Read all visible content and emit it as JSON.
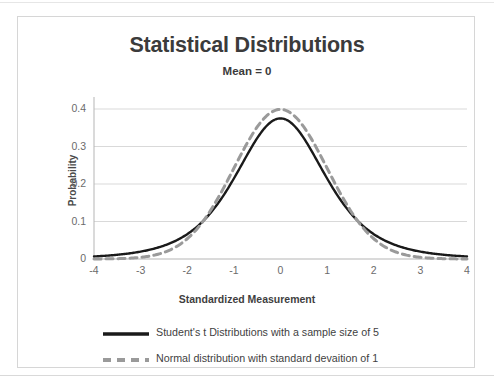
{
  "chart_data": {
    "type": "line",
    "title": "Statistical Distributions",
    "subtitle": "Mean = 0",
    "xlabel": "Standardized Measurement",
    "ylabel": "Probability",
    "xlim": [
      -4,
      4
    ],
    "ylim": [
      0,
      0.4
    ],
    "xticks": [
      "-4",
      "-3",
      "-2",
      "-1",
      "0",
      "1",
      "2",
      "3",
      "4"
    ],
    "yticks": [
      "0",
      "0.1",
      "0.2",
      "0.3",
      "0.4"
    ],
    "grid": "horizontal",
    "legend_position": "bottom",
    "series": [
      {
        "name": "Student's t Distributions with a sample size of 5",
        "style": "solid",
        "color": "#1a1a1a",
        "distribution": "students-t",
        "df": 4,
        "sample_size": 5,
        "x": [
          -4,
          -3.5,
          -3,
          -2.5,
          -2,
          -1.5,
          -1,
          -0.5,
          0,
          0.5,
          1,
          1.5,
          2,
          2.5,
          3,
          3.5,
          4
        ],
        "values": [
          0.0051,
          0.0081,
          0.0135,
          0.024,
          0.045,
          0.0859,
          0.1529,
          0.2618,
          0.375,
          0.2618,
          0.1529,
          0.0859,
          0.045,
          0.024,
          0.0135,
          0.0081,
          0.0051
        ]
      },
      {
        "name": "Normal distribution with standard devaition of 1",
        "style": "dashed",
        "color": "#9a9a9a",
        "distribution": "normal",
        "mean": 0,
        "stdev": 1,
        "x": [
          -4,
          -3.5,
          -3,
          -2.5,
          -2,
          -1.5,
          -1,
          -0.5,
          0,
          0.5,
          1,
          1.5,
          2,
          2.5,
          3,
          3.5,
          4
        ],
        "values": [
          0.0001,
          0.0009,
          0.0044,
          0.0175,
          0.054,
          0.1295,
          0.242,
          0.3521,
          0.3989,
          0.3521,
          0.242,
          0.1295,
          0.054,
          0.0175,
          0.0044,
          0.0009,
          0.0001
        ]
      }
    ]
  },
  "legend": {
    "items": [
      {
        "label": "Student's t Distributions with a sample size of 5"
      },
      {
        "label": "Normal distribution with standard devaition of 1"
      }
    ]
  },
  "colors": {
    "t_line": "#1a1a1a",
    "normal_line": "#9a9a9a",
    "grid": "#d9d9d9",
    "axis": "#b5b5b5",
    "title_text": "#3b3b3b",
    "tick_text": "#6b6b6b",
    "frame": "#d6d6d6"
  }
}
